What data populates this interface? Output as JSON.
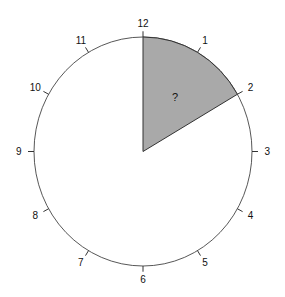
{
  "diagram": {
    "type": "clock-face-sector",
    "center": [
      143,
      151.5
    ],
    "radius_x": 109,
    "radius_y": 114.5,
    "hour_labels": [
      "12",
      "1",
      "2",
      "3",
      "4",
      "5",
      "6",
      "7",
      "8",
      "9",
      "10",
      "11"
    ],
    "shaded_sector": {
      "from_hour": 12,
      "to_hour": 2,
      "label": "?",
      "fill": "#a9a9a9",
      "stroke": "#333333"
    },
    "outline_color": "#444444"
  }
}
